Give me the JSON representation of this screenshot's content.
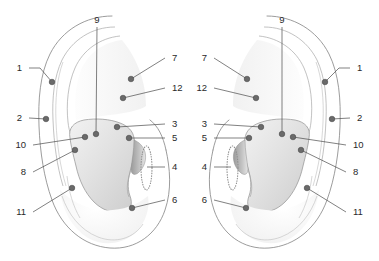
{
  "figure": {
    "subtitle": "Bilateral auricle diagram with numbered points",
    "background_color": "#ffffff",
    "point_color": "#6a6a6a",
    "leader_color": "#4a4a4a",
    "outline_color": "#8a8a8a",
    "label_color": "#2a2a2a"
  },
  "ears": [
    {
      "id": "left-ear",
      "name": "left-ear-panel",
      "side_label": "left",
      "labels": [
        {
          "id": "L1",
          "text": "1",
          "side": "left",
          "x": 22,
          "y": 68,
          "dot_x": 52,
          "dot_y": 82,
          "elbow_x": 40,
          "elbow_y": 68
        },
        {
          "id": "L2",
          "text": "2",
          "side": "left",
          "x": 22,
          "y": 118,
          "dot_x": 46,
          "dot_y": 119,
          "elbow_x": null,
          "elbow_y": null
        },
        {
          "id": "L10",
          "text": "10",
          "side": "left",
          "x": 26,
          "y": 145,
          "dot_x": 85,
          "dot_y": 137,
          "elbow_x": null,
          "elbow_y": null
        },
        {
          "id": "L8",
          "text": "8",
          "side": "left",
          "x": 26,
          "y": 172,
          "dot_x": 75,
          "dot_y": 150,
          "elbow_x": null,
          "elbow_y": null
        },
        {
          "id": "L11",
          "text": "11",
          "side": "left",
          "x": 26,
          "y": 212,
          "dot_x": 72,
          "dot_y": 188,
          "elbow_x": null,
          "elbow_y": null
        },
        {
          "id": "L9",
          "text": "9",
          "side": "top",
          "x": 97,
          "y": 20,
          "dot_x": 96,
          "dot_y": 134,
          "elbow_x": null,
          "elbow_y": null
        },
        {
          "id": "L7",
          "text": "7",
          "side": "right",
          "x": 172,
          "y": 58,
          "dot_x": 131,
          "dot_y": 79,
          "elbow_x": null,
          "elbow_y": null
        },
        {
          "id": "L12",
          "text": "12",
          "side": "right",
          "x": 172,
          "y": 88,
          "dot_x": 123,
          "dot_y": 98,
          "elbow_x": null,
          "elbow_y": null
        },
        {
          "id": "L3",
          "text": "3",
          "side": "right",
          "x": 172,
          "y": 124,
          "dot_x": 117,
          "dot_y": 127,
          "elbow_x": null,
          "elbow_y": null
        },
        {
          "id": "L5",
          "text": "5",
          "side": "right",
          "x": 172,
          "y": 138,
          "dot_x": 129,
          "dot_y": 138,
          "elbow_x": null,
          "elbow_y": null
        },
        {
          "id": "L4",
          "text": "4",
          "side": "right",
          "x": 172,
          "y": 167,
          "dot_x": 147,
          "dot_y": 167,
          "elbow_x": null,
          "elbow_y": null
        },
        {
          "id": "L6",
          "text": "6",
          "side": "right",
          "x": 172,
          "y": 200,
          "dot_x": 132,
          "dot_y": 208,
          "elbow_x": null,
          "elbow_y": null
        }
      ]
    },
    {
      "id": "right-ear",
      "name": "right-ear-panel",
      "side_label": "right",
      "labels": [
        {
          "id": "R1",
          "text": "1",
          "side": "right",
          "x": 357,
          "y": 68,
          "dot_x": 325,
          "dot_y": 82,
          "elbow_x": 339,
          "elbow_y": 68
        },
        {
          "id": "R2",
          "text": "2",
          "side": "right",
          "x": 357,
          "y": 118,
          "dot_x": 332,
          "dot_y": 119,
          "elbow_x": null,
          "elbow_y": null
        },
        {
          "id": "R10",
          "text": "10",
          "side": "right",
          "x": 353,
          "y": 145,
          "dot_x": 293,
          "dot_y": 137,
          "elbow_x": null,
          "elbow_y": null
        },
        {
          "id": "R8",
          "text": "8",
          "side": "right",
          "x": 353,
          "y": 172,
          "dot_x": 301,
          "dot_y": 150,
          "elbow_x": null,
          "elbow_y": null
        },
        {
          "id": "R11",
          "text": "11",
          "side": "right",
          "x": 353,
          "y": 212,
          "dot_x": 307,
          "dot_y": 188,
          "elbow_x": null,
          "elbow_y": null
        },
        {
          "id": "R9",
          "text": "9",
          "side": "top",
          "x": 282,
          "y": 20,
          "dot_x": 282,
          "dot_y": 134,
          "elbow_x": null,
          "elbow_y": null
        },
        {
          "id": "R7",
          "text": "7",
          "side": "left",
          "x": 207,
          "y": 58,
          "dot_x": 247,
          "dot_y": 79,
          "elbow_x": null,
          "elbow_y": null
        },
        {
          "id": "R12",
          "text": "12",
          "side": "left",
          "x": 207,
          "y": 88,
          "dot_x": 256,
          "dot_y": 98,
          "elbow_x": null,
          "elbow_y": null
        },
        {
          "id": "R3",
          "text": "3",
          "side": "left",
          "x": 207,
          "y": 124,
          "dot_x": 261,
          "dot_y": 127,
          "elbow_x": null,
          "elbow_y": null
        },
        {
          "id": "R5",
          "text": "5",
          "side": "left",
          "x": 207,
          "y": 138,
          "dot_x": 249,
          "dot_y": 138,
          "elbow_x": null,
          "elbow_y": null
        },
        {
          "id": "R4",
          "text": "4",
          "side": "left",
          "x": 207,
          "y": 167,
          "dot_x": 231,
          "dot_y": 167,
          "elbow_x": null,
          "elbow_y": null
        },
        {
          "id": "R6",
          "text": "6",
          "side": "left",
          "x": 207,
          "y": 200,
          "dot_x": 246,
          "dot_y": 208,
          "elbow_x": null,
          "elbow_y": null
        }
      ]
    }
  ],
  "point_numbers": [
    "1",
    "2",
    "3",
    "4",
    "5",
    "6",
    "7",
    "8",
    "9",
    "10",
    "11",
    "12"
  ]
}
